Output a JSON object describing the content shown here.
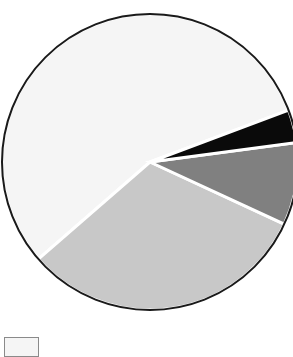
{
  "chart_data": {
    "type": "pie",
    "title": "",
    "categories": [
      "Slice 1",
      "Slice 2",
      "Slice 3",
      "Slice 4"
    ],
    "values": [
      55.7,
      31.7,
      9.0,
      3.6
    ],
    "units": "percent",
    "start_angle_deg": 20.5,
    "direction": "counterclockwise",
    "slice_colors": [
      "#f5f5f5",
      "#c8c8c8",
      "#808080",
      "#0a0a0a"
    ],
    "slice_border_color": "#ffffff",
    "outline_color": "#1a1a1a",
    "legend": {
      "position": "bottom-left",
      "entries": [
        {
          "label": "",
          "color": "#f5f5f5"
        }
      ]
    },
    "grid": false,
    "xlabel": "",
    "ylabel": ""
  },
  "figure": {
    "background": "#ffffff",
    "center_x": 150,
    "center_y": 162,
    "radius": 148
  }
}
